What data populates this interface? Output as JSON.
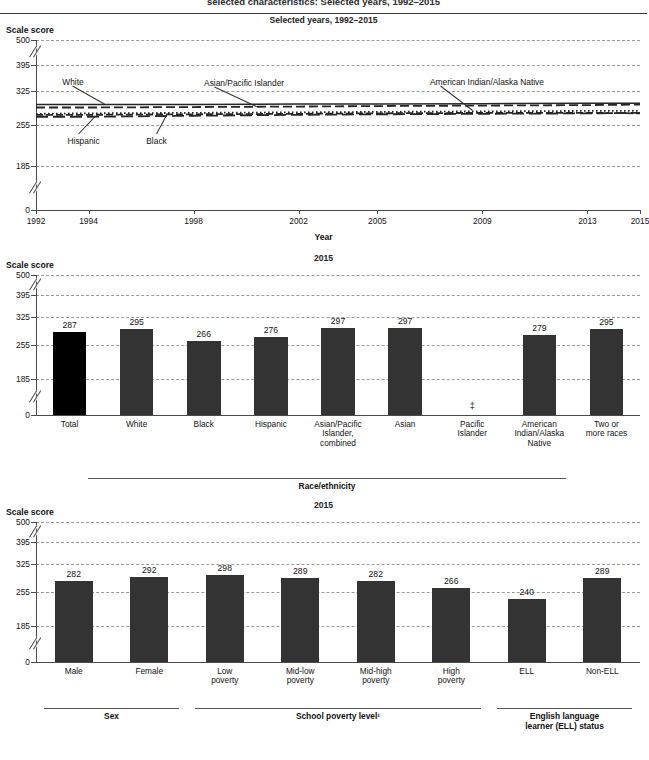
{
  "header": {
    "clipped_title": "selected characteristics: Selected years, 1992–2015"
  },
  "panels": [
    {
      "id": "trend",
      "subtitle": "Selected years, 1992–2015",
      "y_axis_label": "Scale score",
      "x_axis_label": "Year"
    },
    {
      "id": "race",
      "subtitle": "2015",
      "y_axis_label": "Scale score",
      "group_label": "Race/ethnicity"
    },
    {
      "id": "other",
      "subtitle": "2015",
      "y_axis_label": "Scale score",
      "groups": [
        {
          "label": "Sex"
        },
        {
          "label": "School poverty level¹"
        },
        {
          "label": "English language\nlearner (ELL) status"
        }
      ]
    }
  ],
  "chart_data": [
    {
      "type": "line",
      "title": "Selected years, 1992–2015",
      "xlabel": "Year",
      "ylabel": "Scale score",
      "ylim": [
        0,
        500
      ],
      "yticks": [
        0,
        185,
        255,
        325,
        395,
        500
      ],
      "axis_break": true,
      "grid": true,
      "x": [
        1992,
        1994,
        1998,
        2002,
        2005,
        2009,
        2013,
        2015
      ],
      "xticks": [
        "1992",
        "1994",
        "1998",
        "2002",
        "2005",
        "2009",
        "2013",
        "2015"
      ],
      "series": [
        {
          "name": "White",
          "style": "solid",
          "values": [
            297,
            297,
            297,
            298,
            298,
            299,
            300,
            300
          ]
        },
        {
          "name": "Asian/Pacific Islander",
          "style": "dashed",
          "values": [
            291,
            291,
            292,
            293,
            294,
            295,
            296,
            297
          ]
        },
        {
          "name": "Black",
          "style": "dotted",
          "values": [
            278,
            279,
            280,
            281,
            282,
            283,
            284,
            284
          ]
        },
        {
          "name": "Hispanic",
          "style": "dashed-long",
          "values": [
            272,
            272,
            274,
            276,
            277,
            278,
            279,
            280
          ]
        },
        {
          "name": "American Indian/Alaska Native",
          "style": "dash-dot",
          "values": [
            276,
            276,
            277,
            278,
            279,
            280,
            280,
            279
          ]
        }
      ],
      "annotations": [
        {
          "text": "White",
          "x": 1993.0,
          "y": 345
        },
        {
          "text": "Asian/Pacific Islander",
          "x": 1998.4,
          "y": 343
        },
        {
          "text": "American Indian/Alaska Native",
          "x": 2007.0,
          "y": 345
        },
        {
          "text": "Hispanic",
          "x": 1993.2,
          "y": 226
        },
        {
          "text": "Black",
          "x": 1996.2,
          "y": 226
        }
      ]
    },
    {
      "type": "bar",
      "title": "2015",
      "ylabel": "Scale score",
      "xlabel": "Race/ethnicity",
      "ylim": [
        0,
        500
      ],
      "yticks": [
        0,
        185,
        255,
        325,
        395,
        500
      ],
      "axis_break": true,
      "grid": true,
      "categories": [
        "Total",
        "White",
        "Black",
        "Hispanic",
        "Asian/Pacific\nIslander,\ncombined",
        "Asian",
        "Pacific\nIslander",
        "American\nIndian/Alaska\nNative",
        "Two or\nmore races"
      ],
      "values": [
        287,
        295,
        266,
        276,
        297,
        297,
        null,
        279,
        295
      ],
      "value_labels": [
        "287",
        "295",
        "266",
        "276",
        "297",
        "297",
        "‡",
        "279",
        "295"
      ],
      "suppressed": [
        "Pacific\nIslander"
      ],
      "highlight_index": 0
    },
    {
      "type": "bar",
      "title": "2015",
      "ylabel": "Scale score",
      "ylim": [
        0,
        500
      ],
      "yticks": [
        0,
        185,
        255,
        325,
        395,
        500
      ],
      "axis_break": true,
      "grid": true,
      "categories": [
        "Male",
        "Female",
        "Low\npoverty",
        "Mid-low\npoverty",
        "Mid-high\npoverty",
        "High\npoverty",
        "ELL",
        "Non-ELL"
      ],
      "values": [
        282,
        292,
        298,
        289,
        282,
        266,
        240,
        289
      ],
      "value_labels": [
        "282",
        "292",
        "298",
        "289",
        "282",
        "266",
        "240",
        "289"
      ],
      "groups": [
        {
          "label": "Sex",
          "from": 0,
          "to": 1
        },
        {
          "label": "School poverty level¹",
          "from": 2,
          "to": 5
        },
        {
          "label": "English language\nlearner (ELL) status",
          "from": 6,
          "to": 7
        }
      ]
    }
  ]
}
